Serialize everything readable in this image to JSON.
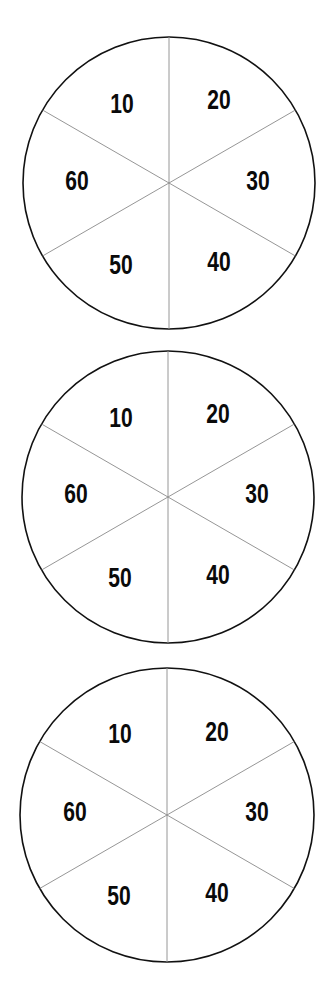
{
  "wheels": [
    {
      "id": "wheel-1",
      "center": [
        169,
        183
      ],
      "radius": 146,
      "segments": [
        {
          "label": "10",
          "pos": [
            122,
            104
          ]
        },
        {
          "label": "20",
          "pos": [
            219,
            100
          ]
        },
        {
          "label": "30",
          "pos": [
            258,
            181
          ]
        },
        {
          "label": "40",
          "pos": [
            219,
            262
          ]
        },
        {
          "label": "50",
          "pos": [
            121,
            265
          ]
        },
        {
          "label": "60",
          "pos": [
            77,
            181
          ]
        }
      ]
    },
    {
      "id": "wheel-2",
      "center": [
        168,
        497
      ],
      "radius": 146,
      "segments": [
        {
          "label": "10",
          "pos": [
            121,
            418
          ]
        },
        {
          "label": "20",
          "pos": [
            218,
            414
          ]
        },
        {
          "label": "30",
          "pos": [
            257,
            494
          ]
        },
        {
          "label": "40",
          "pos": [
            218,
            575
          ]
        },
        {
          "label": "50",
          "pos": [
            120,
            578
          ]
        },
        {
          "label": "60",
          "pos": [
            76,
            494
          ]
        }
      ]
    },
    {
      "id": "wheel-3",
      "center": [
        167,
        815
      ],
      "radius": 147,
      "segments": [
        {
          "label": "10",
          "pos": [
            120,
            734
          ]
        },
        {
          "label": "20",
          "pos": [
            217,
            732
          ]
        },
        {
          "label": "30",
          "pos": [
            257,
            812
          ]
        },
        {
          "label": "40",
          "pos": [
            217,
            893
          ]
        },
        {
          "label": "50",
          "pos": [
            119,
            896
          ]
        },
        {
          "label": "60",
          "pos": [
            75,
            812
          ]
        }
      ]
    }
  ]
}
